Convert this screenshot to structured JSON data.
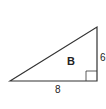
{
  "figure": {
    "shape": "right-triangle",
    "name_label": "B",
    "side_labels": {
      "vertical": "6",
      "horizontal": "8"
    },
    "has_right_angle_marker": true,
    "stroke_color": "#333333"
  }
}
